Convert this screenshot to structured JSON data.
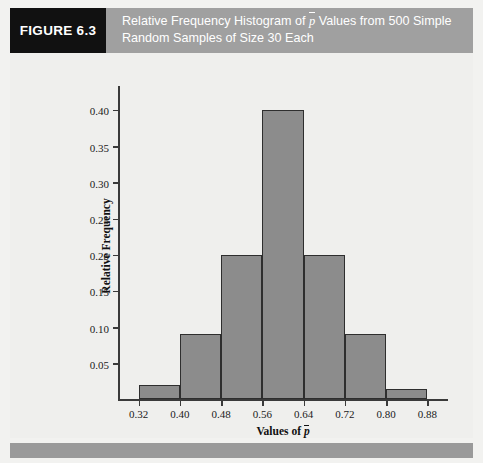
{
  "figure": {
    "badge_label": "FIGURE 6.3",
    "caption_line1_a": "Relative Frequency Histogram of ",
    "caption_line1_pbar": "p",
    "caption_line1_b": " Values from 500 Simple",
    "caption_line2": "Random Samples of Size 30 Each",
    "caption_full": "Relative Frequency Histogram of p̄ Values from 500 Simple Random Samples of Size 30 Each"
  },
  "colors": {
    "header_band": "#a0a0a0",
    "badge_bg": "#111111",
    "bar_fill": "#8c8c8c",
    "bar_border": "#2e2e2e",
    "plot_bg": "#efefed",
    "axis": "#3a3a3a",
    "footer_bar": "#9a9a9a"
  },
  "chart_data": {
    "type": "bar",
    "xlabel_prefix": "Values of ",
    "xlabel_symbol": "p",
    "xlabel": "Values of p̄",
    "ylabel": "Relative Frequency",
    "grid": false,
    "legend": null,
    "xlim": [
      0.28,
      0.92
    ],
    "ylim": [
      0.0,
      0.435
    ],
    "ytick_labels": [
      "0.05",
      "0.10",
      "0.15",
      "0.20",
      "0.25",
      "0.30",
      "0.35",
      "0.40"
    ],
    "ytick_values": [
      0.05,
      0.1,
      0.15,
      0.2,
      0.25,
      0.3,
      0.35,
      0.4
    ],
    "xtick_labels": [
      "0.32",
      "0.40",
      "0.48",
      "0.56",
      "0.64",
      "0.72",
      "0.80",
      "0.88"
    ],
    "xtick_values": [
      0.32,
      0.4,
      0.48,
      0.56,
      0.64,
      0.72,
      0.8,
      0.88
    ],
    "bin_width": 0.08,
    "bars": [
      {
        "bin_start": 0.32,
        "bin_end": 0.4,
        "value": 0.02
      },
      {
        "bin_start": 0.4,
        "bin_end": 0.48,
        "value": 0.09
      },
      {
        "bin_start": 0.48,
        "bin_end": 0.56,
        "value": 0.2
      },
      {
        "bin_start": 0.56,
        "bin_end": 0.64,
        "value": 0.4
      },
      {
        "bin_start": 0.64,
        "bin_end": 0.72,
        "value": 0.2
      },
      {
        "bin_start": 0.72,
        "bin_end": 0.8,
        "value": 0.09
      },
      {
        "bin_start": 0.8,
        "bin_end": 0.88,
        "value": 0.015
      }
    ],
    "categories": [
      "0.32-0.40",
      "0.40-0.48",
      "0.48-0.56",
      "0.56-0.64",
      "0.64-0.72",
      "0.72-0.80",
      "0.80-0.88"
    ],
    "values": [
      0.02,
      0.09,
      0.2,
      0.4,
      0.2,
      0.09,
      0.015
    ]
  }
}
